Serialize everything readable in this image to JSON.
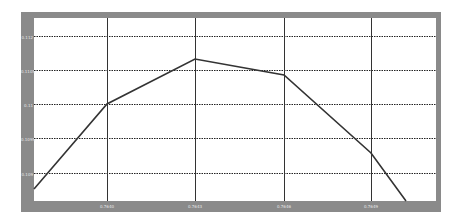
{
  "chart_data": {
    "type": "line",
    "title": "",
    "xlabel": "",
    "ylabel": "",
    "grid": true,
    "x_tick_labels": [
      "0.7640",
      "0.7643",
      "0.7646",
      "0.7649"
    ],
    "y_tick_labels": [
      "0.112",
      "0.1105",
      "0.11",
      "0.1095",
      "0.109"
    ],
    "series": [
      {
        "name": "series-1",
        "color": "#333333",
        "points_px": [
          [
            34,
            189
          ],
          [
            107,
            104
          ],
          [
            195,
            59
          ],
          [
            284,
            75
          ],
          [
            371,
            153
          ],
          [
            406,
            201
          ]
        ]
      }
    ],
    "frame_color": "#8a8a8a",
    "plot_bg": "#ffffff"
  }
}
